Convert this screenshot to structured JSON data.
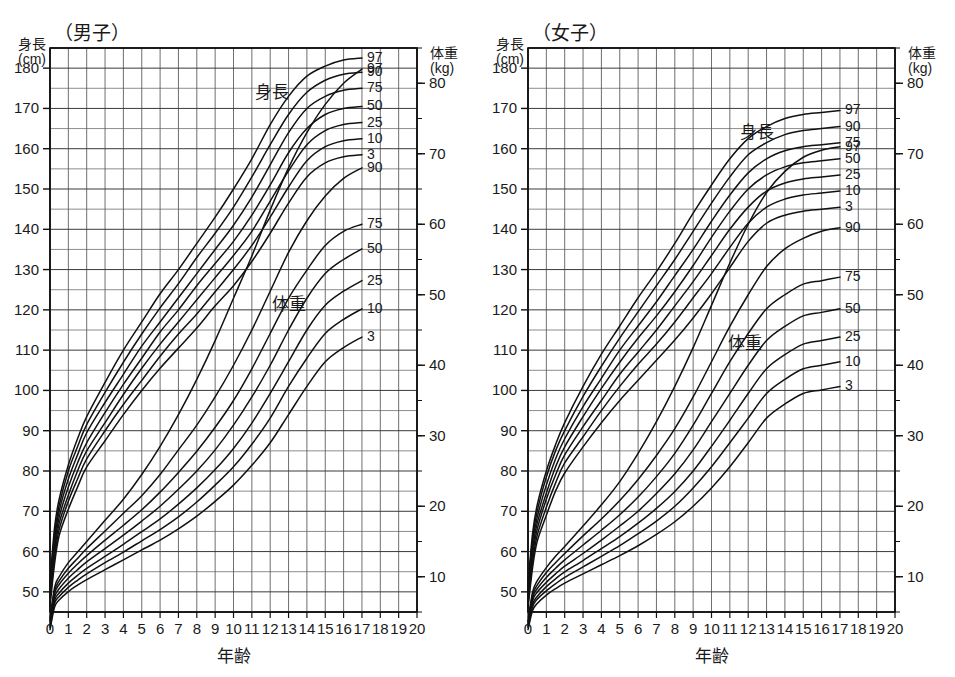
{
  "figure": {
    "kind": "growth-chart-pair",
    "panels": [
      "boys",
      "girls"
    ]
  },
  "boys": {
    "title": "（男子）",
    "height_axis_caption_line1": "身長",
    "height_axis_caption_line2": "(cm)",
    "weight_axis_caption_line1": "体重",
    "weight_axis_caption_line2": "(kg)",
    "x_axis_title": "年齢",
    "height_series_label": "身長",
    "weight_series_label": "体重",
    "percentile_labels": [
      "97",
      "90",
      "75",
      "50",
      "25",
      "10",
      "3"
    ]
  },
  "girls": {
    "title": "（女子）",
    "height_axis_caption_line1": "身長",
    "height_axis_caption_line2": "(cm)",
    "weight_axis_caption_line1": "体重",
    "weight_axis_caption_line2": "(kg)",
    "x_axis_title": "年齢",
    "height_series_label": "身長",
    "weight_series_label": "体重",
    "percentile_labels": [
      "97",
      "90",
      "75",
      "50",
      "25",
      "10",
      "3"
    ]
  },
  "chart_data": [
    {
      "type": "line",
      "title": "（男子）",
      "xlabel": "年齢",
      "ylabel": "身長 (cm)",
      "y2label": "体重 (kg)",
      "xlim": [
        0,
        20
      ],
      "ylim": [
        45,
        185
      ],
      "y2lim": [
        5,
        85
      ],
      "grid": true,
      "legend": "curve-end-labels",
      "xticks": [
        0,
        1,
        2,
        3,
        4,
        5,
        6,
        7,
        8,
        9,
        10,
        11,
        12,
        13,
        14,
        15,
        16,
        17,
        18,
        19,
        20
      ],
      "yticks": [
        50,
        60,
        70,
        80,
        90,
        100,
        110,
        120,
        130,
        140,
        150,
        160,
        170,
        180
      ],
      "y2ticks": [
        10,
        20,
        30,
        40,
        50,
        60,
        70,
        80
      ],
      "x": [
        0,
        0.25,
        0.5,
        1,
        1.5,
        2,
        3,
        4,
        5,
        6,
        7,
        8,
        9,
        10,
        11,
        12,
        13,
        14,
        15,
        16,
        17
      ],
      "series": [
        {
          "name": "身長 97",
          "axis": "y",
          "values": [
            52.5,
            66.0,
            73.0,
            81.5,
            88.0,
            93.5,
            102.0,
            110.0,
            117.0,
            124.0,
            130.0,
            136.5,
            143.0,
            150.0,
            157.5,
            166.0,
            173.0,
            178.0,
            180.5,
            182.0,
            182.5
          ]
        },
        {
          "name": "身長 90",
          "axis": "y",
          "values": [
            51.5,
            64.5,
            71.5,
            80.0,
            86.0,
            91.5,
            99.5,
            107.0,
            114.0,
            120.5,
            126.5,
            133.0,
            139.0,
            145.5,
            153.0,
            161.0,
            168.5,
            174.0,
            177.0,
            178.5,
            179.0
          ]
        },
        {
          "name": "身長 75",
          "axis": "y",
          "values": [
            50.5,
            63.0,
            70.0,
            78.0,
            84.0,
            89.5,
            97.0,
            104.0,
            111.0,
            117.0,
            123.0,
            129.0,
            135.0,
            141.0,
            148.0,
            156.0,
            164.0,
            170.0,
            173.0,
            174.5,
            175.0
          ]
        },
        {
          "name": "身長 50",
          "axis": "y",
          "values": [
            49.5,
            61.5,
            68.5,
            76.0,
            82.0,
            87.0,
            94.5,
            101.5,
            108.0,
            114.5,
            120.0,
            126.0,
            131.5,
            137.0,
            143.5,
            151.0,
            159.0,
            165.0,
            168.5,
            170.0,
            170.5
          ]
        },
        {
          "name": "身長 25",
          "axis": "y",
          "values": [
            48.5,
            60.0,
            67.0,
            74.0,
            80.0,
            85.0,
            92.0,
            99.0,
            105.5,
            111.5,
            117.0,
            122.5,
            128.0,
            133.5,
            139.5,
            147.0,
            154.5,
            161.0,
            164.5,
            166.0,
            166.5
          ]
        },
        {
          "name": "身長 10",
          "axis": "y",
          "values": [
            47.5,
            58.5,
            65.5,
            72.5,
            78.0,
            83.0,
            90.0,
            96.5,
            102.5,
            108.5,
            114.0,
            119.0,
            124.5,
            130.0,
            136.0,
            143.0,
            150.5,
            157.0,
            160.5,
            162.0,
            162.5
          ]
        },
        {
          "name": "身長 3",
          "axis": "y",
          "values": [
            46.5,
            57.0,
            64.0,
            70.5,
            76.0,
            81.0,
            87.5,
            94.0,
            100.0,
            105.5,
            110.5,
            115.5,
            121.0,
            126.0,
            132.0,
            139.0,
            146.5,
            153.0,
            156.5,
            158.0,
            158.5
          ]
        },
        {
          "name": "体重 97",
          "axis": "y2",
          "values": [
            4.0,
            8.5,
            10.0,
            12.0,
            13.5,
            15.0,
            18.0,
            21.0,
            24.5,
            28.5,
            33.0,
            38.0,
            43.5,
            49.5,
            55.5,
            62.0,
            68.0,
            73.0,
            77.0,
            80.0,
            82.0
          ]
        },
        {
          "name": "体重 90",
          "axis": "y2",
          "values": [
            3.8,
            8.0,
            9.4,
            11.2,
            12.6,
            14.0,
            16.5,
            19.0,
            21.5,
            24.5,
            28.0,
            31.5,
            35.5,
            40.0,
            45.0,
            50.5,
            56.0,
            60.5,
            64.0,
            66.5,
            68.0
          ]
        },
        {
          "name": "体重 75",
          "axis": "y2",
          "values": [
            3.6,
            7.6,
            8.9,
            10.5,
            11.8,
            13.0,
            15.2,
            17.3,
            19.5,
            22.0,
            24.8,
            27.8,
            31.2,
            35.0,
            39.5,
            44.5,
            49.5,
            53.5,
            57.0,
            59.0,
            60.0
          ]
        },
        {
          "name": "体重 50",
          "axis": "y2",
          "values": [
            3.3,
            7.1,
            8.3,
            9.8,
            11.0,
            12.1,
            14.0,
            15.9,
            17.9,
            20.0,
            22.4,
            25.0,
            28.0,
            31.5,
            35.5,
            40.0,
            45.0,
            49.5,
            53.0,
            55.0,
            56.5
          ]
        },
        {
          "name": "体重 25",
          "axis": "y2",
          "values": [
            3.0,
            6.6,
            7.7,
            9.1,
            10.2,
            11.2,
            12.9,
            14.6,
            16.4,
            18.2,
            20.3,
            22.6,
            25.2,
            28.2,
            31.8,
            36.0,
            40.5,
            45.0,
            48.5,
            50.5,
            52.0
          ]
        },
        {
          "name": "体重 10",
          "axis": "y2",
          "values": [
            2.8,
            6.2,
            7.2,
            8.5,
            9.5,
            10.4,
            12.0,
            13.5,
            15.1,
            16.7,
            18.5,
            20.6,
            23.0,
            25.6,
            28.8,
            32.5,
            37.0,
            41.0,
            44.5,
            46.5,
            48.0
          ]
        },
        {
          "name": "体重 3",
          "axis": "y2",
          "values": [
            2.5,
            5.7,
            6.7,
            7.9,
            8.8,
            9.6,
            11.0,
            12.4,
            13.8,
            15.2,
            16.8,
            18.6,
            20.7,
            23.0,
            25.8,
            29.0,
            33.0,
            37.0,
            40.5,
            42.5,
            44.0
          ]
        }
      ]
    },
    {
      "type": "line",
      "title": "（女子）",
      "xlabel": "年齢",
      "ylabel": "身長 (cm)",
      "y2label": "体重 (kg)",
      "xlim": [
        0,
        20
      ],
      "ylim": [
        45,
        185
      ],
      "y2lim": [
        5,
        85
      ],
      "grid": true,
      "legend": "curve-end-labels",
      "xticks": [
        0,
        1,
        2,
        3,
        4,
        5,
        6,
        7,
        8,
        9,
        10,
        11,
        12,
        13,
        14,
        15,
        16,
        17,
        18,
        19,
        20
      ],
      "yticks": [
        50,
        60,
        70,
        80,
        90,
        100,
        110,
        120,
        130,
        140,
        150,
        160,
        170,
        180
      ],
      "y2ticks": [
        10,
        20,
        30,
        40,
        50,
        60,
        70,
        80
      ],
      "x": [
        0,
        0.25,
        0.5,
        1,
        1.5,
        2,
        3,
        4,
        5,
        6,
        7,
        8,
        9,
        10,
        11,
        12,
        13,
        14,
        15,
        16,
        17
      ],
      "series": [
        {
          "name": "身長 97",
          "axis": "y",
          "values": [
            52.0,
            64.5,
            71.5,
            80.0,
            86.5,
            92.0,
            101.0,
            109.0,
            116.0,
            123.0,
            129.5,
            136.5,
            144.0,
            151.0,
            157.5,
            162.5,
            165.5,
            167.5,
            168.5,
            169.0,
            169.5
          ]
        },
        {
          "name": "身長 90",
          "axis": "y",
          "values": [
            51.0,
            63.0,
            70.0,
            78.5,
            85.0,
            90.0,
            98.5,
            106.0,
            113.0,
            119.5,
            126.0,
            132.5,
            139.5,
            146.5,
            153.0,
            158.5,
            161.5,
            163.5,
            164.5,
            165.0,
            165.5
          ]
        },
        {
          "name": "身長 75",
          "axis": "y",
          "values": [
            50.0,
            62.0,
            68.5,
            76.5,
            83.0,
            88.0,
            96.0,
            103.0,
            110.0,
            116.0,
            122.0,
            128.5,
            135.0,
            142.0,
            148.5,
            154.0,
            157.5,
            159.5,
            160.5,
            161.0,
            161.5
          ]
        },
        {
          "name": "身長 50",
          "axis": "y",
          "values": [
            49.0,
            60.5,
            67.0,
            74.5,
            81.0,
            86.0,
            93.5,
            100.5,
            107.0,
            113.0,
            118.5,
            124.5,
            131.0,
            138.0,
            144.5,
            150.0,
            153.5,
            155.5,
            156.5,
            157.0,
            157.5
          ]
        },
        {
          "name": "身長 25",
          "axis": "y",
          "values": [
            48.0,
            59.0,
            65.5,
            73.0,
            79.0,
            84.0,
            91.0,
            97.5,
            104.0,
            109.5,
            115.0,
            121.0,
            127.0,
            133.5,
            140.0,
            145.5,
            149.5,
            151.5,
            152.5,
            153.0,
            153.5
          ]
        },
        {
          "name": "身長 10",
          "axis": "y",
          "values": [
            47.0,
            57.5,
            64.0,
            71.0,
            77.0,
            82.0,
            88.5,
            95.0,
            101.0,
            106.5,
            111.5,
            117.0,
            123.0,
            129.0,
            135.5,
            141.5,
            145.5,
            147.5,
            148.5,
            149.0,
            149.5
          ]
        },
        {
          "name": "身長 3",
          "axis": "y",
          "values": [
            46.0,
            56.0,
            62.5,
            69.0,
            75.0,
            79.5,
            86.0,
            92.0,
            97.5,
            102.5,
            107.5,
            112.5,
            118.0,
            124.0,
            130.5,
            137.0,
            141.5,
            143.5,
            144.5,
            145.0,
            145.5
          ]
        },
        {
          "name": "体重 97",
          "axis": "y2",
          "values": [
            3.8,
            7.8,
            9.4,
            11.3,
            12.9,
            14.3,
            17.2,
            20.2,
            23.5,
            27.5,
            32.0,
            37.0,
            42.5,
            48.5,
            54.5,
            60.0,
            64.5,
            67.5,
            69.5,
            70.5,
            71.0
          ]
        },
        {
          "name": "体重 90",
          "axis": "y2",
          "values": [
            3.6,
            7.4,
            8.8,
            10.6,
            12.0,
            13.3,
            15.8,
            18.2,
            20.8,
            23.8,
            27.2,
            31.0,
            35.5,
            40.5,
            45.5,
            50.0,
            54.0,
            56.5,
            58.0,
            59.0,
            59.5
          ]
        },
        {
          "name": "体重 75",
          "axis": "y2",
          "values": [
            3.4,
            7.0,
            8.3,
            9.9,
            11.2,
            12.4,
            14.5,
            16.6,
            18.8,
            21.3,
            24.2,
            27.5,
            31.5,
            36.0,
            40.5,
            44.5,
            48.0,
            50.0,
            51.5,
            52.0,
            52.5
          ]
        },
        {
          "name": "体重 50",
          "axis": "y2",
          "values": [
            3.2,
            6.6,
            7.8,
            9.2,
            10.4,
            11.5,
            13.3,
            15.2,
            17.2,
            19.3,
            21.8,
            24.6,
            28.0,
            32.0,
            36.0,
            40.0,
            43.5,
            45.5,
            47.0,
            47.5,
            48.0
          ]
        },
        {
          "name": "体重 25",
          "axis": "y2",
          "values": [
            3.0,
            6.1,
            7.2,
            8.6,
            9.7,
            10.7,
            12.3,
            14.0,
            15.7,
            17.6,
            19.7,
            22.1,
            25.0,
            28.5,
            32.2,
            36.0,
            39.5,
            41.5,
            43.0,
            43.5,
            44.0
          ]
        },
        {
          "name": "体重 10",
          "axis": "y2",
          "values": [
            2.8,
            5.7,
            6.8,
            8.0,
            9.0,
            9.9,
            11.4,
            12.9,
            14.4,
            16.1,
            17.9,
            20.0,
            22.6,
            25.6,
            29.0,
            32.5,
            36.0,
            38.0,
            39.5,
            40.0,
            40.5
          ]
        },
        {
          "name": "体重 3",
          "axis": "y2",
          "values": [
            2.5,
            5.2,
            6.2,
            7.4,
            8.3,
            9.1,
            10.4,
            11.7,
            13.0,
            14.4,
            16.0,
            17.8,
            20.0,
            22.6,
            25.6,
            29.0,
            32.5,
            34.5,
            36.0,
            36.5,
            37.0
          ]
        }
      ]
    }
  ]
}
